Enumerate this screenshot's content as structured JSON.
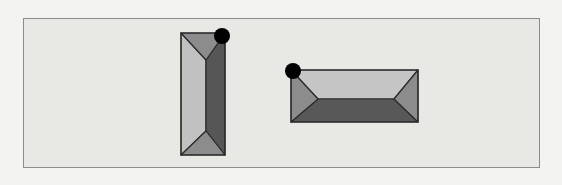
{
  "canvas": {
    "width": 562,
    "height": 185,
    "background_color": "#f4f4f2"
  },
  "panel": {
    "label": "scene-panel",
    "x": 23,
    "y": 18,
    "width": 517,
    "height": 150,
    "fill_color": "#e9e9e6",
    "border_color": "#8c8c8c",
    "border_width": 1
  },
  "shapes": [
    {
      "id": "left-prism",
      "label": "vertical-rectangular-prism",
      "orientation": "vertical",
      "bounds": {
        "x": 181,
        "y": 33,
        "width": 44,
        "height": 122
      },
      "inner_edge_x": 206,
      "inner_top_y": 60,
      "inner_bottom_y": 131,
      "outline_color": "#2b2b2b",
      "outline_width": 1.2,
      "faces": {
        "left_face_color": "#c2c2c2",
        "right_face_color": "#565656",
        "top_face_color": "#8d8d8d",
        "bottom_face_color": "#8d8d8d"
      },
      "marker": {
        "label": "vertex-marker-top-right",
        "cx": 222,
        "cy": 36,
        "r": 8,
        "color": "#000000"
      }
    },
    {
      "id": "right-prism",
      "label": "horizontal-rectangular-prism",
      "orientation": "horizontal",
      "bounds": {
        "x": 291,
        "y": 70,
        "width": 127,
        "height": 52
      },
      "inner_edge_y": 99,
      "inner_left_x": 318,
      "inner_right_x": 394,
      "outline_color": "#2b2b2b",
      "outline_width": 1.2,
      "faces": {
        "top_face_color": "#c6c6c6",
        "bottom_face_color": "#585858",
        "left_face_color": "#8d8d8d",
        "right_face_color": "#8d8d8d"
      },
      "marker": {
        "label": "vertex-marker-top-left",
        "cx": 293,
        "cy": 71,
        "r": 8,
        "color": "#000000"
      }
    }
  ]
}
